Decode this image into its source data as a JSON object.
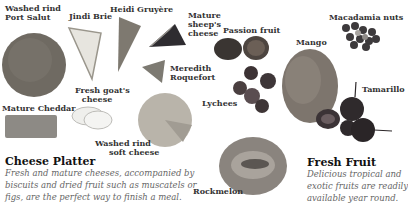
{
  "cheese_section": {
    "heading": "Cheese Platter",
    "description_lines": [
      "Fresh and mature cheeses, accompanied by",
      "biscuits and dried fruit such as muscatels or",
      "figs, are the perfect way to finish a meal."
    ],
    "labels": {
      "washed_rind_port_salut": [
        "Washed rind",
        "Port Salut"
      ],
      "jindi_brie": "Jindi Brie",
      "heidi_gruyere": "Heidi Gruyère",
      "mature_sheeps_cheese": [
        "Mature",
        "sheep's",
        "cheese"
      ],
      "meredith_roquefort": [
        "Meredith",
        "Roquefort"
      ],
      "mature_cheddar": "Mature Cheddar",
      "fresh_goats_cheese": [
        "Fresh goat's",
        "cheese"
      ],
      "washed_rind_soft_cheese": [
        "Washed rind",
        "soft cheese"
      ]
    }
  },
  "fruit_section": {
    "heading": "Fresh Fruit",
    "description_lines": [
      "Delicious tropical and",
      "exotic fruits are readily",
      "available year round."
    ],
    "labels": {
      "passion_fruit": "Passion fruit",
      "macadamia_nuts": "Macadamia nuts",
      "mango": "Mango",
      "lychees": "Lychees",
      "tamarillo": "Tamarillo",
      "rockmelon": "Rockmelon"
    }
  }
}
